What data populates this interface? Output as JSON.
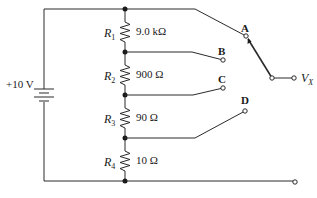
{
  "diagram": {
    "type": "voltage-divider-switch-circuit",
    "source": {
      "label": "+10 V"
    },
    "resistors": [
      {
        "name": "R",
        "sub": "1",
        "value": "9.0 kΩ"
      },
      {
        "name": "R",
        "sub": "2",
        "value": "900 Ω"
      },
      {
        "name": "R",
        "sub": "3",
        "value": "90 Ω"
      },
      {
        "name": "R",
        "sub": "4",
        "value": "10 Ω"
      }
    ],
    "switch_positions": [
      "A",
      "B",
      "C",
      "D"
    ],
    "output": {
      "name": "V",
      "sub": "X"
    },
    "colors": {
      "line": "#2a2a2a",
      "background": "#ffffff"
    }
  }
}
